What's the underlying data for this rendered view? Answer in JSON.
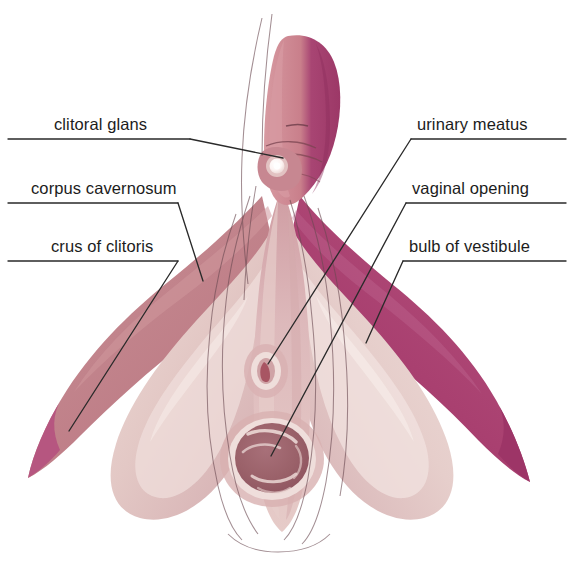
{
  "figure": {
    "background_color": "#ffffff",
    "width": 574,
    "height": 581
  },
  "palette": {
    "outer_magenta": "#a94070",
    "deep_magenta": "#b5537f",
    "rose_mid": "#c0757f",
    "rose_light": "#cf8d96",
    "dusty_rose": "#c08b93",
    "body_pink": "#d9b3b8",
    "pale_pink": "#e3c8c8",
    "palest_pink": "#edd9d6",
    "bulb_pink": "#e0c0bd",
    "vagina_mauve": "#9e6670",
    "vagina_dark": "#8d5360",
    "meatus_red": "#a85563",
    "glans_white": "#ffffff",
    "leader_line": "#2a2a2a",
    "contour_line": "#6b4a52",
    "label_text": "#1c1c1c"
  },
  "labels": {
    "left": [
      {
        "id": "clitoral-glans",
        "text": "clitoral glans",
        "text_x": 54,
        "text_y": 116,
        "underline": {
          "x1": 8,
          "y1": 139,
          "x2": 190,
          "y2": 139
        },
        "leader": "M190,139 L283,158"
      },
      {
        "id": "corpus-cavernosum",
        "text": "corpus cavernosum",
        "text_x": 31,
        "text_y": 180,
        "underline": {
          "x1": 8,
          "y1": 203,
          "x2": 178,
          "y2": 203
        },
        "leader": "M178,203 L203,281"
      },
      {
        "id": "crus-of-clitoris",
        "text": "crus of clitoris",
        "text_x": 51,
        "text_y": 238,
        "underline": {
          "x1": 8,
          "y1": 261,
          "x2": 178,
          "y2": 261
        },
        "leader": "M178,261 L69,431"
      }
    ],
    "right": [
      {
        "id": "urinary-meatus",
        "text": "urinary meatus",
        "text_x": 417,
        "text_y": 116,
        "underline": {
          "x1": 411,
          "y1": 139,
          "x2": 566,
          "y2": 139
        },
        "leader": "M411,139 L268,364"
      },
      {
        "id": "vaginal-opening",
        "text": "vaginal opening",
        "text_x": 412,
        "text_y": 180,
        "underline": {
          "x1": 406,
          "y1": 203,
          "x2": 566,
          "y2": 203
        },
        "leader": "M406,203 L271,456"
      },
      {
        "id": "bulb-of-vestibule",
        "text": "bulb of vestibule",
        "text_x": 409,
        "text_y": 238,
        "underline": {
          "x1": 403,
          "y1": 261,
          "x2": 566,
          "y2": 261
        },
        "leader": "M403,261 L366,343"
      }
    ]
  },
  "structures": [
    {
      "id": "shaft",
      "name": "clitoral shaft / body"
    },
    {
      "id": "glans",
      "name": "clitoral glans"
    },
    {
      "id": "crus-left",
      "name": "left crus of clitoris"
    },
    {
      "id": "crus-right",
      "name": "right crus of clitoris"
    },
    {
      "id": "bulb-left",
      "name": "left bulb of vestibule"
    },
    {
      "id": "bulb-right",
      "name": "right bulb of vestibule"
    },
    {
      "id": "urinary-meatus",
      "name": "urinary meatus"
    },
    {
      "id": "vaginal-opening",
      "name": "vaginal opening"
    }
  ]
}
